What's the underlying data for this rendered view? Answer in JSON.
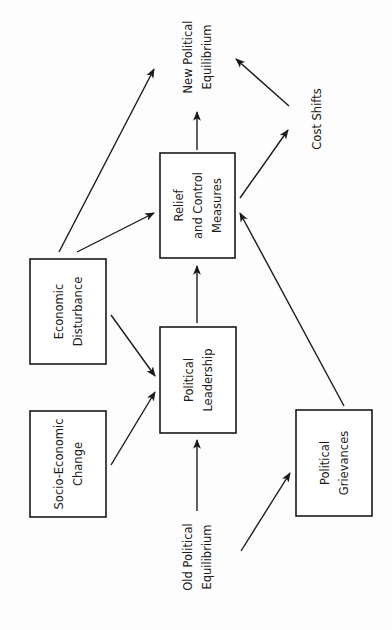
{
  "diagram": {
    "orientation": "rotated-90-ccw",
    "nodes": [
      {
        "id": "old_eq",
        "type": "label",
        "lines": [
          "Old Political",
          "Equilibrium"
        ],
        "cx": 197,
        "cy": 557
      },
      {
        "id": "socio",
        "type": "box",
        "lines": [
          "Socio-Economic",
          "Change"
        ],
        "x": 30,
        "y": 411,
        "w": 76,
        "h": 106
      },
      {
        "id": "econ",
        "type": "box",
        "lines": [
          "Economic",
          "Disturbance"
        ],
        "x": 30,
        "y": 259,
        "w": 76,
        "h": 105
      },
      {
        "id": "pol_lead",
        "type": "box",
        "lines": [
          "Political",
          "Leadership"
        ],
        "x": 160,
        "y": 327,
        "w": 76,
        "h": 106
      },
      {
        "id": "grievances",
        "type": "box",
        "lines": [
          "Political",
          "Grievances"
        ],
        "x": 296,
        "y": 410,
        "w": 76,
        "h": 106
      },
      {
        "id": "relief",
        "type": "box",
        "lines": [
          "Relief",
          "and Control",
          "Measures"
        ],
        "x": 160,
        "y": 153,
        "w": 75,
        "h": 105
      },
      {
        "id": "cost_shifts",
        "type": "label",
        "lines": [
          "Cost Shifts"
        ],
        "cx": 317,
        "cy": 119
      },
      {
        "id": "new_eq",
        "type": "label",
        "lines": [
          "New Political",
          "Equilibrium"
        ],
        "cx": 197,
        "cy": 57
      }
    ],
    "edges": [
      {
        "from": "Old Political Equilibrium",
        "to": "Political Leadership",
        "x1": 197,
        "y1": 511,
        "x2": 197,
        "y2": 440
      },
      {
        "from": "Old Political Equilibrium",
        "to": "Political Grievances",
        "x1": 241,
        "y1": 551,
        "x2": 290,
        "y2": 473
      },
      {
        "from": "Socio-Economic Change",
        "to": "Political Leadership",
        "x1": 111,
        "y1": 465,
        "x2": 155,
        "y2": 392
      },
      {
        "from": "Economic Disturbance",
        "to": "Political Leadership",
        "x1": 111,
        "y1": 315,
        "x2": 155,
        "y2": 376
      },
      {
        "from": "Economic Disturbance",
        "to": "Relief and Control Measures",
        "x1": 77,
        "y1": 252,
        "x2": 154,
        "y2": 213
      },
      {
        "from": "Economic Disturbance",
        "to": "New Political Equilibrium",
        "x1": 59,
        "y1": 252,
        "x2": 154,
        "y2": 69
      },
      {
        "from": "Political Leadership",
        "to": "Relief and Control Measures",
        "x1": 197,
        "y1": 323,
        "x2": 197,
        "y2": 266
      },
      {
        "from": "Political Grievances",
        "to": "Relief and Control Measures",
        "x1": 344,
        "y1": 406,
        "x2": 240,
        "y2": 213
      },
      {
        "from": "Relief and Control Measures",
        "to": "New Political Equilibrium",
        "x1": 197,
        "y1": 150,
        "x2": 197,
        "y2": 112
      },
      {
        "from": "Relief and Control Measures",
        "to": "Cost Shifts",
        "x1": 240,
        "y1": 198,
        "x2": 288,
        "y2": 130
      },
      {
        "from": "Cost Shifts",
        "to": "New Political Equilibrium",
        "x1": 289,
        "y1": 106,
        "x2": 236,
        "y2": 59
      }
    ],
    "colors": {
      "ink": "#1a1a1a",
      "background": "#fdfdfd"
    }
  }
}
